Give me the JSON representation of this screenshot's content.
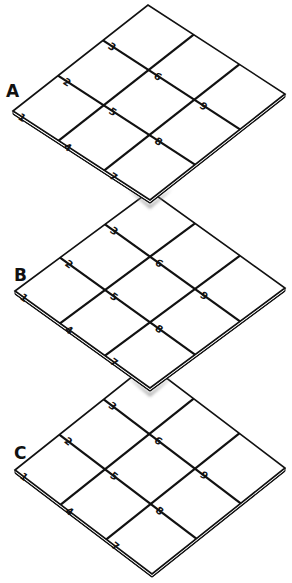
{
  "colors": {
    "line": "#111111",
    "paper": "#ffffff",
    "shadow": "#9a9a9a"
  },
  "boards": [
    {
      "label": "A",
      "left": [
        13,
        111
      ],
      "u": [
        135,
        -106
      ],
      "v": [
        137,
        89
      ],
      "label_pos": [
        6,
        97
      ],
      "cells": [
        "1",
        "2",
        "3",
        "4",
        "5",
        "6",
        "7",
        "8",
        "9"
      ]
    },
    {
      "label": "B",
      "left": [
        15,
        291
      ],
      "u": [
        135,
        -100
      ],
      "v": [
        135,
        97
      ],
      "label_pos": [
        14,
        281
      ],
      "cells": [
        "1",
        "2",
        "3",
        "4",
        "5",
        "6",
        "7",
        "8",
        "9"
      ]
    },
    {
      "label": "C",
      "left": [
        15,
        470
      ],
      "u": [
        133,
        -106
      ],
      "v": [
        137,
        104
      ],
      "label_pos": [
        14,
        459
      ],
      "cells": [
        "1",
        "2",
        "3",
        "4",
        "5",
        "6",
        "7",
        "8",
        "9"
      ]
    }
  ]
}
